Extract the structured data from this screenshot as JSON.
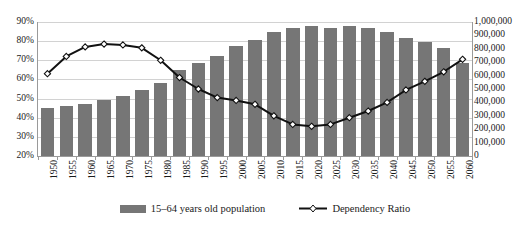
{
  "chart_data": {
    "type": "bar",
    "title": "",
    "xlabel": "",
    "ylabel": "",
    "grid": true,
    "legend_position": "bottom",
    "categories": [
      "1950",
      "1955",
      "1960",
      "1965",
      "1970",
      "1975",
      "1980",
      "1985",
      "1990",
      "1995",
      "2000",
      "2005",
      "2010",
      "2015",
      "2020",
      "2025",
      "2030",
      "2035",
      "2040",
      "2045",
      "2050",
      "2055",
      "2060"
    ],
    "axes": {
      "left": {
        "label": "",
        "ylim": [
          20,
          90
        ],
        "tick_step": 10,
        "ticks": [
          "20%",
          "30%",
          "40%",
          "50%",
          "60%",
          "70%",
          "80%",
          "90%"
        ],
        "tick_values": [
          20,
          30,
          40,
          50,
          60,
          70,
          80,
          90
        ]
      },
      "right": {
        "label": "",
        "ylim": [
          0,
          1000000
        ],
        "tick_step": 100000,
        "ticks": [
          "0",
          "100,000",
          "200,000",
          "300,000",
          "400,000",
          "500,000",
          "600,000",
          "700,000",
          "800,000",
          "900,000",
          "1,000,000"
        ],
        "tick_values": [
          0,
          100000,
          200000,
          300000,
          400000,
          500000,
          600000,
          700000,
          800000,
          900000,
          1000000
        ]
      }
    },
    "series": [
      {
        "name": "15–64 years old population",
        "type": "bar",
        "axis": "right",
        "color": "#767676",
        "values": [
          358000,
          373000,
          388000,
          418000,
          448000,
          493000,
          545000,
          642000,
          694000,
          746000,
          821000,
          866000,
          925000,
          955000,
          970000,
          955000,
          970000,
          955000,
          925000,
          881000,
          851000,
          806000,
          694000
        ]
      },
      {
        "name": "Dependency Ratio",
        "type": "line",
        "axis": "left",
        "color": "#111111",
        "marker": "diamond",
        "values": [
          63.0,
          72.0,
          77.0,
          78.5,
          78.0,
          76.5,
          70.0,
          61.0,
          55.0,
          50.5,
          49.0,
          47.0,
          41.0,
          36.5,
          35.5,
          36.5,
          40.0,
          43.5,
          48.0,
          54.5,
          59.0,
          64.0,
          70.5
        ]
      }
    ]
  },
  "legend": {
    "items": [
      {
        "label": "15–64 years old population",
        "marker": "bar-swatch"
      },
      {
        "label": "Dependency Ratio",
        "marker": "line-diamond-swatch"
      }
    ]
  }
}
